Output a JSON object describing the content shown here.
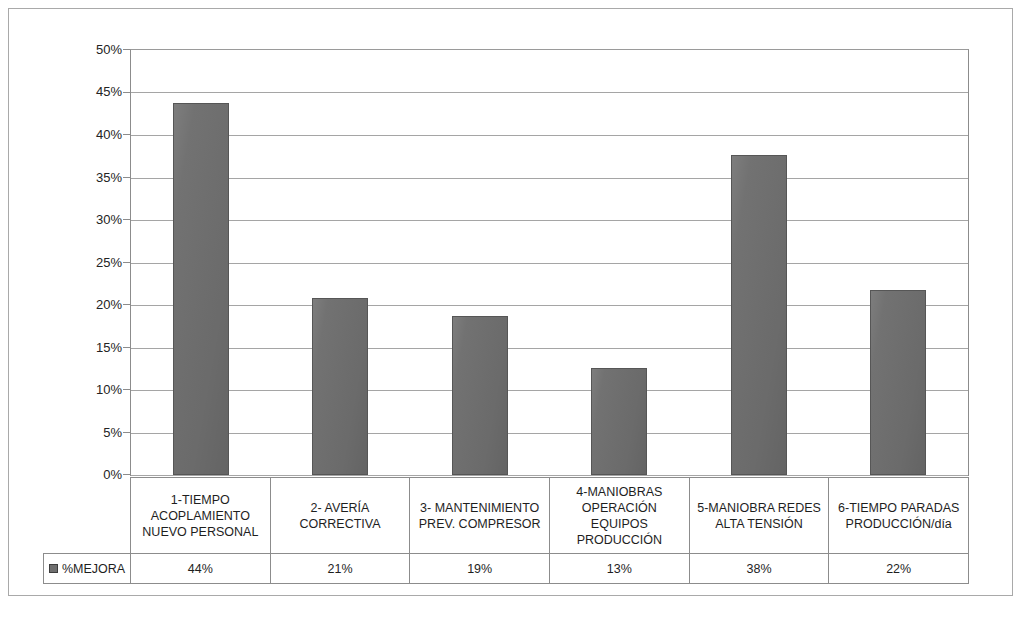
{
  "chart_data": {
    "type": "bar",
    "title": "",
    "xlabel": "",
    "ylabel": "",
    "ylim": [
      0,
      0.5
    ],
    "grid": true,
    "legend_position": "data-table-left",
    "categories": [
      "1-TIEMPO ACOPLAMIENTO NUEVO PERSONAL",
      "2- AVERÍA CORRECTIVA",
      "3- MANTENIMIENTO PREV. COMPRESOR",
      "4-MANIOBRAS OPERACIÓN EQUIPOS PRODUCCIÓN",
      "5-MANIOBRA REDES ALTA TENSIÓN",
      "6-TIEMPO PARADAS PRODUCCIÓN/día"
    ],
    "series": [
      {
        "name": "%MEJORA",
        "values": [
          0.44,
          0.21,
          0.19,
          0.13,
          0.38,
          0.22
        ],
        "plotted_values": [
          0.438,
          0.208,
          0.187,
          0.126,
          0.376,
          0.218
        ],
        "color": "#6f6f6f"
      }
    ],
    "y_ticks": [
      "0%",
      "5%",
      "10%",
      "15%",
      "20%",
      "25%",
      "30%",
      "35%",
      "40%",
      "45%",
      "50%"
    ],
    "y_tick_values": [
      0,
      0.05,
      0.1,
      0.15,
      0.2,
      0.25,
      0.3,
      0.35,
      0.4,
      0.45,
      0.5
    ]
  },
  "data_table": {
    "legend_label": "%MEJORA",
    "category_labels": [
      [
        "1-TIEMPO",
        "ACOPLAMIENTO",
        "NUEVO PERSONAL"
      ],
      [
        "2- AVERÍA",
        "CORRECTIVA"
      ],
      [
        "3- MANTENIMIENTO",
        "PREV. COMPRESOR"
      ],
      [
        "4-MANIOBRAS",
        "OPERACIÓN",
        "EQUIPOS",
        "PRODUCCIÓN"
      ],
      [
        "5-MANIOBRA REDES",
        "ALTA TENSIÓN"
      ],
      [
        "6-TIEMPO PARADAS",
        "PRODUCCIÓN/día"
      ]
    ],
    "values": [
      "44%",
      "21%",
      "19%",
      "13%",
      "38%",
      "22%"
    ]
  }
}
